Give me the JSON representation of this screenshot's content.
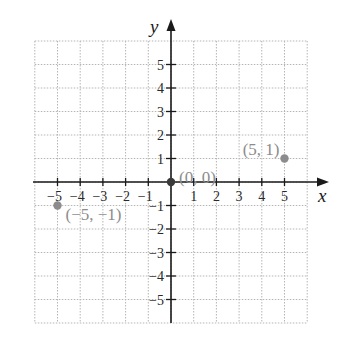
{
  "chart_data": {
    "type": "scatter",
    "title": "",
    "xlabel": "x",
    "ylabel": "y",
    "xlim": [
      -6,
      6
    ],
    "ylim": [
      -6,
      6
    ],
    "grid": true,
    "grid_style": "dotted",
    "x_ticks": [
      -5,
      -4,
      -3,
      -2,
      -1,
      1,
      2,
      3,
      4,
      5
    ],
    "y_ticks": [
      -5,
      -4,
      -3,
      -2,
      -1,
      1,
      2,
      3,
      4,
      5
    ],
    "x_tick_labels": [
      "−5",
      "−4",
      "−3",
      "−2",
      "−1",
      "1",
      "2",
      "3",
      "4",
      "5"
    ],
    "y_tick_labels": [
      "−5",
      "−4",
      "−3",
      "−2",
      "−1",
      "1",
      "2",
      "3",
      "4",
      "5"
    ],
    "points": [
      {
        "x": 0,
        "y": 0,
        "label": "(0, 0)"
      },
      {
        "x": 5,
        "y": 1,
        "label": "(5, 1)"
      },
      {
        "x": -5,
        "y": -1,
        "label": "(−5, −1)"
      }
    ],
    "colors": {
      "axis": "#1a1a1a",
      "grid": "#b5b5b5",
      "point": "#8c8c8c",
      "origin_point": "#3a3a3a",
      "point_label": "#8c8c8c"
    }
  }
}
